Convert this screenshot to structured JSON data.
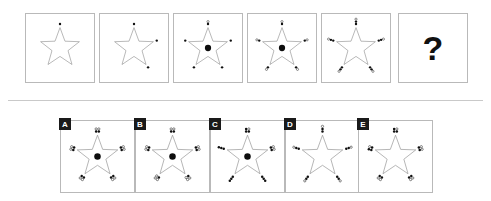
{
  "puzzle": {
    "type": "visual-analogy-matrix",
    "question_mark": "?",
    "sequence_label_row": "top",
    "sequence": [
      {
        "index": 1,
        "name": "sequence-panel-1",
        "star": true,
        "center_dot": false,
        "vertex_dot_count": 1,
        "vertices_with_dots": [
          "top"
        ],
        "dots": [
          {
            "vertex": "top",
            "filled": 1,
            "outlined": 0
          }
        ]
      },
      {
        "index": 2,
        "name": "sequence-panel-2",
        "star": true,
        "center_dot": false,
        "vertex_dot_count": 1,
        "vertices_with_dots": [
          "top",
          "right",
          "bottom-right"
        ],
        "dots": [
          {
            "vertex": "top",
            "filled": 1,
            "outlined": 0
          },
          {
            "vertex": "right",
            "filled": 1,
            "outlined": 0
          },
          {
            "vertex": "bottom-right",
            "filled": 1,
            "outlined": 0
          }
        ]
      },
      {
        "index": 3,
        "name": "sequence-panel-3",
        "star": true,
        "center_dot": true,
        "vertex_dot_count": 1,
        "vertices_with_dots": [
          "top",
          "right",
          "bottom-right",
          "bottom-left",
          "left"
        ],
        "dots": [
          {
            "vertex": "top",
            "filled": 1,
            "outlined": 1
          },
          {
            "vertex": "right",
            "filled": 1,
            "outlined": 0
          },
          {
            "vertex": "bottom-right",
            "filled": 1,
            "outlined": 0
          },
          {
            "vertex": "bottom-left",
            "filled": 1,
            "outlined": 0
          },
          {
            "vertex": "left",
            "filled": 1,
            "outlined": 0
          }
        ]
      },
      {
        "index": 4,
        "name": "sequence-panel-4",
        "star": true,
        "center_dot": true,
        "vertex_dot_count": 2,
        "vertices_with_dots": [
          "top",
          "right",
          "bottom-right",
          "bottom-left",
          "left"
        ],
        "dots": [
          {
            "vertex": "top",
            "filled": 1,
            "outlined": 1
          },
          {
            "vertex": "right",
            "filled": 1,
            "outlined": 1
          },
          {
            "vertex": "bottom-right",
            "filled": 1,
            "outlined": 1
          },
          {
            "vertex": "bottom-left",
            "filled": 1,
            "outlined": 1
          },
          {
            "vertex": "left",
            "filled": 1,
            "outlined": 1
          }
        ]
      },
      {
        "index": 5,
        "name": "sequence-panel-5",
        "star": true,
        "center_dot": false,
        "vertex_dot_count": 3,
        "vertices_with_dots": [
          "top",
          "right",
          "bottom-right",
          "bottom-left",
          "left"
        ],
        "dots": [
          {
            "vertex": "top",
            "filled": 2,
            "outlined": 1
          },
          {
            "vertex": "right",
            "filled": 2,
            "outlined": 1
          },
          {
            "vertex": "bottom-right",
            "filled": 2,
            "outlined": 1
          },
          {
            "vertex": "bottom-left",
            "filled": 2,
            "outlined": 1
          },
          {
            "vertex": "left",
            "filled": 2,
            "outlined": 1
          }
        ]
      },
      {
        "index": 6,
        "name": "sequence-panel-missing",
        "star": false,
        "missing": true,
        "label": "?"
      }
    ],
    "options": [
      {
        "letter": "A",
        "name": "option-a",
        "star": true,
        "center_dot": true,
        "vertex_dot_count": 4,
        "pattern": "2x2 cluster, mixed filled and outlined",
        "dots": [
          {
            "vertex": "top",
            "filled": 2,
            "outlined": 2
          },
          {
            "vertex": "right",
            "filled": 2,
            "outlined": 2
          },
          {
            "vertex": "bottom-right",
            "filled": 2,
            "outlined": 2
          },
          {
            "vertex": "bottom-left",
            "filled": 2,
            "outlined": 2
          },
          {
            "vertex": "left",
            "filled": 2,
            "outlined": 2
          }
        ]
      },
      {
        "letter": "B",
        "name": "option-b",
        "star": true,
        "center_dot": true,
        "vertex_dot_count": 4,
        "pattern": "2x2 cluster, mostly outlined",
        "dots": [
          {
            "vertex": "top",
            "filled": 2,
            "outlined": 2
          },
          {
            "vertex": "right",
            "filled": 2,
            "outlined": 2
          },
          {
            "vertex": "bottom-right",
            "filled": 1,
            "outlined": 3
          },
          {
            "vertex": "bottom-left",
            "filled": 1,
            "outlined": 3
          },
          {
            "vertex": "left",
            "filled": 2,
            "outlined": 2
          }
        ]
      },
      {
        "letter": "C",
        "name": "option-c",
        "star": true,
        "center_dot": true,
        "vertex_dot_count": 4,
        "pattern": "2x2 cluster, filled dominant",
        "dots": [
          {
            "vertex": "top",
            "filled": 3,
            "outlined": 1
          },
          {
            "vertex": "right",
            "filled": 2,
            "outlined": 2
          },
          {
            "vertex": "bottom-right",
            "filled": 3,
            "outlined": 0
          },
          {
            "vertex": "bottom-left",
            "filled": 3,
            "outlined": 0
          },
          {
            "vertex": "left",
            "filled": 3,
            "outlined": 0
          }
        ]
      },
      {
        "letter": "D",
        "name": "option-d",
        "star": true,
        "center_dot": false,
        "vertex_dot_count": 3,
        "pattern": "radial line of 3 dots, no centre dot",
        "dots": [
          {
            "vertex": "top",
            "filled": 2,
            "outlined": 1
          },
          {
            "vertex": "right",
            "filled": 2,
            "outlined": 1
          },
          {
            "vertex": "bottom-right",
            "filled": 2,
            "outlined": 1
          },
          {
            "vertex": "bottom-left",
            "filled": 2,
            "outlined": 1
          },
          {
            "vertex": "left",
            "filled": 2,
            "outlined": 1
          }
        ]
      },
      {
        "letter": "E",
        "name": "option-e",
        "star": true,
        "center_dot": false,
        "vertex_dot_count": 4,
        "pattern": "2x2 cluster, no centre dot",
        "dots": [
          {
            "vertex": "top",
            "filled": 3,
            "outlined": 1
          },
          {
            "vertex": "right",
            "filled": 2,
            "outlined": 2
          },
          {
            "vertex": "bottom-right",
            "filled": 2,
            "outlined": 2
          },
          {
            "vertex": "bottom-left",
            "filled": 2,
            "outlined": 2
          },
          {
            "vertex": "left",
            "filled": 3,
            "outlined": 1
          }
        ]
      }
    ],
    "colors": {
      "background": "#ffffff",
      "panel_border": "#b9b9b9",
      "star_stroke": "#8c8c8c",
      "dot_fill": "#101010",
      "tag_background": "#1a1a1a",
      "tag_text": "#ffffff",
      "divider": "#c9c9c9"
    },
    "layout": {
      "sequence_panel_size": 70,
      "sequence_panel_top": 13,
      "sequence_panel_lefts": [
        25,
        99,
        173,
        247,
        321,
        398
      ],
      "option_panel_width": 75,
      "option_panel_height": 73,
      "option_panel_top": 120,
      "option_panel_lefts": [
        60,
        135,
        210,
        285,
        358
      ],
      "divider_y": 100
    }
  }
}
